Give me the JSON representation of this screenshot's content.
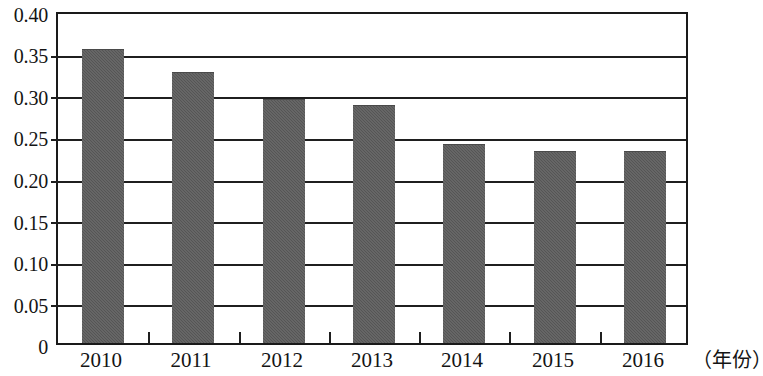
{
  "chart_data": {
    "type": "bar",
    "title": "",
    "subtitle": "",
    "xlabel": "（年份）",
    "ylabel": "",
    "categories": [
      "2010",
      "2011",
      "2012",
      "2013",
      "2014",
      "2015",
      "2016"
    ],
    "values": [
      0.356,
      0.328,
      0.295,
      0.288,
      0.241,
      0.232,
      0.232
    ],
    "series": [
      {
        "name": "",
        "values": [
          0.356,
          0.328,
          0.295,
          0.288,
          0.241,
          0.232,
          0.232
        ]
      }
    ],
    "ylim": [
      0,
      0.4
    ],
    "ytick_values": [
      0,
      0.05,
      0.1,
      0.15,
      0.2,
      0.25,
      0.3,
      0.35,
      0.4
    ],
    "ytick_labels": [
      "0",
      "0.05",
      "0.10",
      "0.15",
      "0.20",
      "0.25",
      "0.30",
      "0.35",
      "0.40"
    ],
    "grid": true,
    "grid_axis": "y",
    "legend": false,
    "legend_position": "none",
    "bar_color": "#555555",
    "axis_color": "#1a1a1a",
    "background_color": "#ffffff",
    "annotations": []
  },
  "axis": {
    "y_labels": [
      "0.40",
      "0.35",
      "0.30",
      "0.25",
      "0.20",
      "0.15",
      "0.10",
      "0.05",
      "0"
    ],
    "x_labels": [
      "2010",
      "2011",
      "2012",
      "2013",
      "2014",
      "2015",
      "2016"
    ],
    "x_title": "（年份）"
  }
}
